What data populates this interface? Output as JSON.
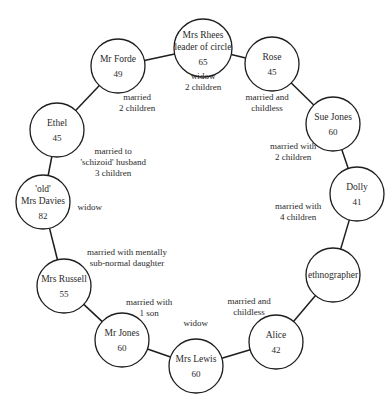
{
  "diagram": {
    "type": "social-network-circle",
    "nodes": [
      {
        "id": "mrs-rhees",
        "lines": [
          "Mrs Rhees",
          "leader of circle"
        ],
        "age": "65",
        "x": 203,
        "y": 48,
        "r": 29
      },
      {
        "id": "rose",
        "lines": [
          "Rose"
        ],
        "age": "45",
        "x": 272,
        "y": 64,
        "r": 27
      },
      {
        "id": "sue-jones",
        "lines": [
          "Sue Jones"
        ],
        "age": "60",
        "x": 333,
        "y": 124,
        "r": 27
      },
      {
        "id": "dolly",
        "lines": [
          "Dolly"
        ],
        "age": "41",
        "x": 357,
        "y": 194,
        "r": 27
      },
      {
        "id": "ethnographer",
        "lines": [
          "ethnographer"
        ],
        "age": "",
        "x": 333,
        "y": 275,
        "r": 27
      },
      {
        "id": "alice",
        "lines": [
          "Alice"
        ],
        "age": "42",
        "x": 276,
        "y": 342,
        "r": 27
      },
      {
        "id": "mrs-lewis",
        "lines": [
          "Mrs Lewis"
        ],
        "age": "60",
        "x": 196,
        "y": 366,
        "r": 27
      },
      {
        "id": "mr-jones",
        "lines": [
          "Mr Jones"
        ],
        "age": "60",
        "x": 122,
        "y": 340,
        "r": 27
      },
      {
        "id": "mrs-russell",
        "lines": [
          "Mrs Russell"
        ],
        "age": "55",
        "x": 64,
        "y": 286,
        "r": 27
      },
      {
        "id": "old-mrs-davies",
        "lines": [
          "'old'",
          "Mrs Davies"
        ],
        "age": "82",
        "x": 43,
        "y": 202,
        "r": 27
      },
      {
        "id": "ethel",
        "lines": [
          "Ethel"
        ],
        "age": "45",
        "x": 57,
        "y": 130,
        "r": 27
      },
      {
        "id": "mr-forde",
        "lines": [
          "Mr Forde"
        ],
        "age": "49",
        "x": 118,
        "y": 66,
        "r": 27
      }
    ],
    "edges": [
      [
        "mrs-rhees",
        "rose"
      ],
      [
        "rose",
        "sue-jones"
      ],
      [
        "sue-jones",
        "dolly"
      ],
      [
        "dolly",
        "ethnographer"
      ],
      [
        "ethnographer",
        "alice"
      ],
      [
        "alice",
        "mrs-lewis"
      ],
      [
        "mrs-lewis",
        "mr-jones"
      ],
      [
        "mr-jones",
        "mrs-russell"
      ],
      [
        "mrs-russell",
        "old-mrs-davies"
      ],
      [
        "old-mrs-davies",
        "ethel"
      ],
      [
        "ethel",
        "mr-forde"
      ],
      [
        "mr-forde",
        "mrs-rhees"
      ]
    ],
    "annotations": [
      {
        "for": "mrs-rhees",
        "lines": [
          "widow",
          "2 children"
        ],
        "x": 203,
        "y": 76
      },
      {
        "for": "rose",
        "lines": [
          "married and",
          "childless"
        ],
        "x": 267,
        "y": 97
      },
      {
        "for": "sue-jones",
        "lines": [
          "married with",
          "2 children"
        ],
        "x": 293,
        "y": 146
      },
      {
        "for": "dolly",
        "lines": [
          "married with",
          "4 children"
        ],
        "x": 298,
        "y": 206
      },
      {
        "for": "alice",
        "lines": [
          "married and",
          "childless"
        ],
        "x": 249,
        "y": 301
      },
      {
        "for": "mrs-lewis",
        "lines": [
          "widow"
        ],
        "x": 196,
        "y": 323
      },
      {
        "for": "mr-jones",
        "lines": [
          "married with",
          "1 son"
        ],
        "x": 149,
        "y": 302
      },
      {
        "for": "mrs-russell",
        "lines": [
          "married with mentally",
          "sub-normal daughter"
        ],
        "x": 127,
        "y": 252
      },
      {
        "for": "old-mrs-davies",
        "lines": [
          "widow"
        ],
        "x": 90,
        "y": 207
      },
      {
        "for": "ethel",
        "lines": [
          "married to",
          "'schizoid' husband",
          "3 children"
        ],
        "x": 113,
        "y": 151
      },
      {
        "for": "mr-forde",
        "lines": [
          "married",
          "2 children"
        ],
        "x": 137,
        "y": 97
      }
    ]
  }
}
